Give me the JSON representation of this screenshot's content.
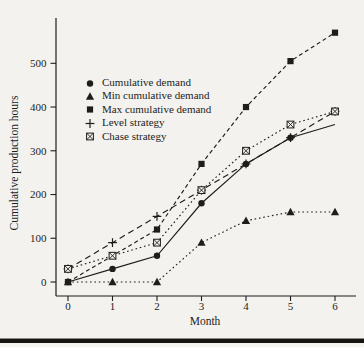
{
  "figure": {
    "background": "#f3f2ef",
    "ink": "#1d1d1b"
  },
  "chart_data": {
    "type": "line",
    "title": "",
    "xlabel": "Month",
    "ylabel": "Cumulative production hours",
    "x": [
      0,
      1,
      2,
      3,
      4,
      5,
      6
    ],
    "xticks": [
      0,
      1,
      2,
      3,
      4,
      5,
      6
    ],
    "yticks": [
      0,
      100,
      200,
      300,
      400,
      500
    ],
    "ylim": [
      0,
      590
    ],
    "grid": false,
    "legend_position": "upper-left-inside",
    "series": [
      {
        "name": "Cumulative demand",
        "marker": "circle",
        "line": "solid",
        "values": [
          0,
          30,
          60,
          180,
          270,
          330,
          360
        ],
        "skip_last_marker": true
      },
      {
        "name": "Min cumulative demand",
        "marker": "triangle",
        "line": "dotted",
        "values": [
          0,
          0,
          0,
          90,
          140,
          160,
          160
        ]
      },
      {
        "name": "Max cumulative demand",
        "marker": "square",
        "line": "dashed-short",
        "values": [
          0,
          60,
          120,
          270,
          400,
          505,
          570
        ]
      },
      {
        "name": "Level strategy",
        "marker": "plus",
        "line": "dashed",
        "values": [
          30,
          90,
          150,
          210,
          270,
          330,
          390
        ]
      },
      {
        "name": "Chase strategy",
        "marker": "boxed-x",
        "line": "dotted",
        "values": [
          30,
          60,
          90,
          210,
          300,
          360,
          390
        ]
      }
    ]
  }
}
